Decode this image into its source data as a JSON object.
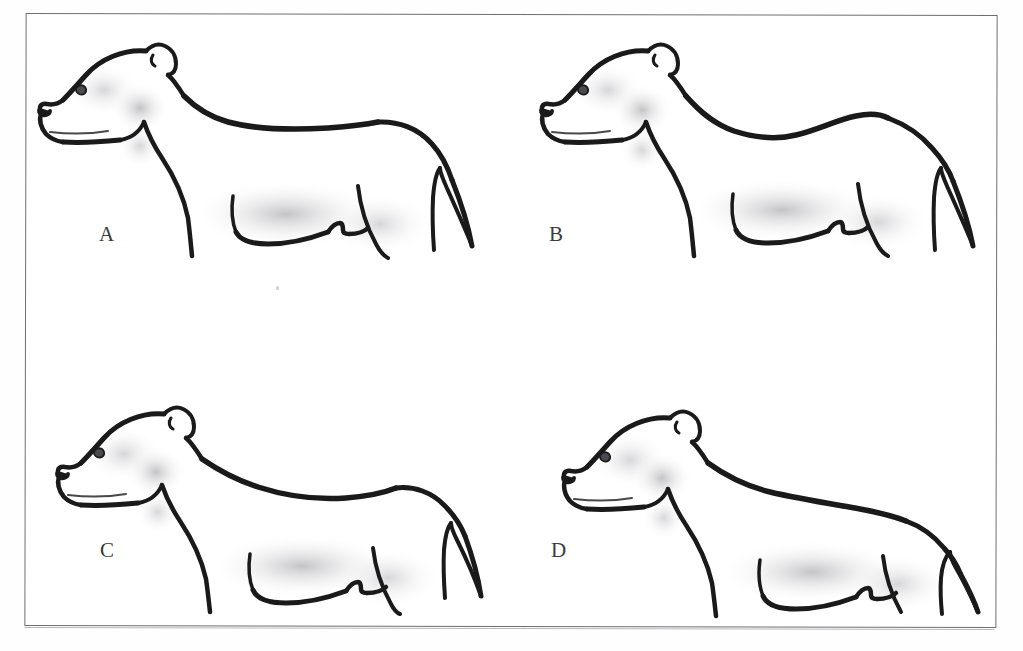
{
  "page": {
    "background_color": "#ffffff",
    "plate_border_color": "#6f6f73"
  },
  "plate": {
    "figures": [
      {
        "label": "A",
        "name": "dog-profile-a",
        "description": "Dog profile line drawing with level straight topline"
      },
      {
        "label": "B",
        "name": "dog-profile-b",
        "description": "Dog profile line drawing with dipped sagging topline"
      },
      {
        "label": "C",
        "name": "dog-profile-c",
        "description": "Dog profile line drawing with roached rising topline"
      },
      {
        "label": "D",
        "name": "dog-profile-d",
        "description": "Dog profile line drawing with sloping topline"
      }
    ]
  },
  "caption": {
    "ghost_text": ""
  }
}
